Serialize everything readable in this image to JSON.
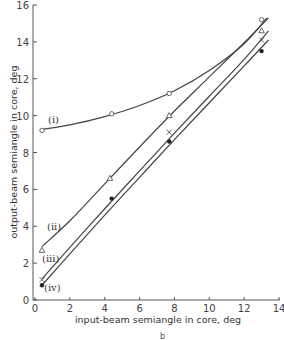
{
  "chart_data": {
    "type": "line",
    "title": "",
    "xlabel": "input-beam semiangle in core, deg",
    "ylabel": "output-beam semiangle in core, deg",
    "xlim": [
      0,
      14
    ],
    "ylim": [
      0,
      16
    ],
    "xticks": [
      0,
      2,
      4,
      6,
      8,
      10,
      12,
      14
    ],
    "yticks": [
      0,
      2,
      4,
      6,
      8,
      10,
      12,
      14,
      16
    ],
    "grid": false,
    "legend": "inline curve labels",
    "sublabel": "b",
    "series": [
      {
        "name": "(i)",
        "marker": "open-circle",
        "points": [
          [
            0.4,
            9.2
          ],
          [
            4.4,
            10.1
          ],
          [
            7.7,
            11.2
          ],
          [
            13.0,
            15.2
          ]
        ],
        "curve": [
          [
            0.4,
            9.25
          ],
          [
            2,
            9.5
          ],
          [
            4,
            9.95
          ],
          [
            6,
            10.55
          ],
          [
            8,
            11.35
          ],
          [
            10,
            12.45
          ],
          [
            12,
            13.9
          ],
          [
            13.3,
            15.3
          ]
        ]
      },
      {
        "name": "(ii)",
        "marker": "open-triangle",
        "points": [
          [
            0.4,
            2.7
          ],
          [
            4.3,
            6.6
          ],
          [
            7.7,
            10.0
          ],
          [
            13.0,
            14.6
          ]
        ],
        "curve": [
          [
            0.4,
            2.9
          ],
          [
            2,
            4.3
          ],
          [
            4,
            6.3
          ],
          [
            6,
            8.3
          ],
          [
            8,
            10.25
          ],
          [
            10,
            12.1
          ],
          [
            12,
            13.95
          ],
          [
            13.4,
            15.3
          ]
        ]
      },
      {
        "name": "(iii)",
        "marker": "cross",
        "points": [
          [
            0.4,
            1.1
          ],
          [
            7.7,
            9.1
          ],
          [
            13.0,
            14.1
          ]
        ],
        "curve": [
          [
            0.4,
            1.15
          ],
          [
            2,
            2.85
          ],
          [
            4,
            4.95
          ],
          [
            6,
            7.0
          ],
          [
            8,
            9.05
          ],
          [
            10,
            11.05
          ],
          [
            12,
            13.05
          ],
          [
            13.4,
            14.6
          ]
        ]
      },
      {
        "name": "(iv)",
        "marker": "filled-circle",
        "points": [
          [
            0.4,
            0.8
          ],
          [
            4.4,
            5.5
          ],
          [
            7.7,
            8.6
          ],
          [
            13.0,
            13.5
          ]
        ],
        "curve": [
          [
            0.4,
            0.8
          ],
          [
            2,
            2.5
          ],
          [
            4,
            4.6
          ],
          [
            6,
            6.65
          ],
          [
            8,
            8.7
          ],
          [
            10,
            10.7
          ],
          [
            12,
            12.7
          ],
          [
            13.4,
            14.1
          ]
        ]
      }
    ]
  },
  "labels": {
    "x_axis_title": "input-beam semiangle in core, deg",
    "y_axis_title": "output-beam semiangle in core, deg",
    "curve_i": "(i)",
    "curve_ii": "(ii)",
    "curve_iii": "(iii)",
    "curve_iv": "(iv)",
    "sub": "b"
  }
}
